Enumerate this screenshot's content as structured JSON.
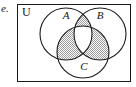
{
  "item": {
    "label": "e."
  },
  "diagram": {
    "type": "venn-3-set",
    "universe_label": "U",
    "universe_rect": {
      "x": 17,
      "y": 4,
      "width": 114,
      "height": 78
    },
    "stroke_color": "#1a1a1a",
    "fill_color": "#ffffff",
    "shade_color": "#b9b9b9",
    "shaded_regions": [
      "A∩B only",
      "A∩C only",
      "B∩C only"
    ],
    "unshaded_regions": [
      "A only",
      "B only",
      "C only",
      "A∩B∩C",
      "outside"
    ],
    "sets": [
      {
        "name": "A",
        "label": "A",
        "cx": 66,
        "cy": 34,
        "r": 26,
        "label_x": 66,
        "label_y": 19
      },
      {
        "name": "B",
        "label": "B",
        "cx": 100,
        "cy": 34,
        "r": 26,
        "label_x": 100,
        "label_y": 19
      },
      {
        "name": "C",
        "label": "C",
        "cx": 83,
        "cy": 52,
        "r": 26,
        "label_x": 84,
        "label_y": 70
      }
    ]
  }
}
